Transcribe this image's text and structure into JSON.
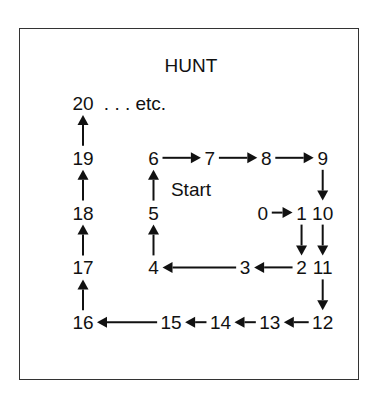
{
  "title": "HUNT",
  "start_label": "Start",
  "continuation": ". . . etc.",
  "nodes": [
    {
      "label": "0",
      "col": 2.55,
      "row": 2
    },
    {
      "label": "1",
      "col": 3.1,
      "row": 2
    },
    {
      "label": "2",
      "col": 3.1,
      "row": 3
    },
    {
      "label": "3",
      "col": 2.3,
      "row": 3
    },
    {
      "label": "4",
      "col": 1,
      "row": 3
    },
    {
      "label": "5",
      "col": 1,
      "row": 2
    },
    {
      "label": "6",
      "col": 1,
      "row": 1
    },
    {
      "label": "7",
      "col": 1.8,
      "row": 1
    },
    {
      "label": "8",
      "col": 2.6,
      "row": 1
    },
    {
      "label": "9",
      "col": 3.4,
      "row": 1
    },
    {
      "label": "10",
      "col": 3.4,
      "row": 2
    },
    {
      "label": "11",
      "col": 3.4,
      "row": 3
    },
    {
      "label": "12",
      "col": 3.4,
      "row": 4
    },
    {
      "label": "13",
      "col": 2.65,
      "row": 4
    },
    {
      "label": "14",
      "col": 1.95,
      "row": 4
    },
    {
      "label": "15",
      "col": 1.25,
      "row": 4
    },
    {
      "label": "16",
      "col": 0,
      "row": 4
    },
    {
      "label": "17",
      "col": 0,
      "row": 3
    },
    {
      "label": "18",
      "col": 0,
      "row": 2
    },
    {
      "label": "19",
      "col": 0,
      "row": 1
    },
    {
      "label": "20",
      "col": 0,
      "row": 0
    }
  ],
  "arrows": [
    [
      0,
      1
    ],
    [
      1,
      2
    ],
    [
      2,
      3
    ],
    [
      3,
      4
    ],
    [
      4,
      5
    ],
    [
      5,
      6
    ],
    [
      6,
      7
    ],
    [
      7,
      8
    ],
    [
      8,
      9
    ],
    [
      9,
      10
    ],
    [
      10,
      11
    ],
    [
      11,
      12
    ],
    [
      12,
      13
    ],
    [
      13,
      14
    ],
    [
      14,
      15
    ],
    [
      15,
      16
    ],
    [
      16,
      17
    ],
    [
      17,
      18
    ],
    [
      18,
      19
    ],
    [
      19,
      20
    ]
  ]
}
